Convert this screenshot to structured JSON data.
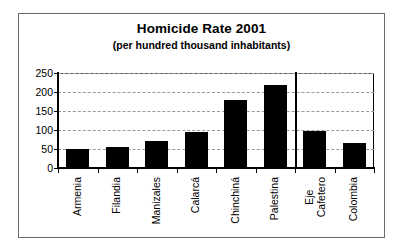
{
  "chart_data": {
    "type": "bar",
    "title": "Homicide Rate 2001",
    "subtitle": "(per hundred thousand inhabitants)",
    "xlabel": "",
    "ylabel": "",
    "ylim": [
      0,
      250
    ],
    "yticks": [
      0,
      50,
      100,
      150,
      200,
      250
    ],
    "ytick_labels": [
      "0",
      "50",
      "100",
      "150",
      "200",
      "250"
    ],
    "grid": true,
    "legend": false,
    "orientation": "vertical",
    "bar_color": "#000000",
    "categories": [
      "Armenia",
      "Filandia",
      "Manizales",
      "Calarcá",
      "Chinchiná",
      "Palestina",
      "Eje\nCafetero",
      "Colombia"
    ],
    "values": [
      51,
      55,
      72,
      95,
      178,
      218,
      97,
      67
    ],
    "annotations": [
      {
        "type": "vertical-separator",
        "after_category": "Palestina",
        "note": "divides municipalities from regional/national aggregates"
      }
    ]
  },
  "frame": {
    "border_color": "#6b6b6b",
    "axis_color": "#000000",
    "gridline_color": "#9a9a9a"
  }
}
